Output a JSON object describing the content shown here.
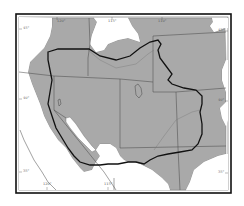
{
  "map": {
    "type": "range map",
    "region": "Western United States",
    "colors": {
      "background": "#ffffff",
      "shaded_region": "#a9a9a9",
      "state_borders": "#555555",
      "range_outline": "#111111",
      "frame": "#111111",
      "water": "#ffffff"
    },
    "longitude_labels_top": [
      "120°",
      "115°",
      "110°"
    ],
    "longitude_labels_bottom": [
      "120°",
      "115°"
    ],
    "latitude_labels_left": [
      "45°",
      "40°",
      "35°"
    ],
    "latitude_labels_right": [
      "45°",
      "40°",
      "35°"
    ],
    "legend": "thick black outline = species range boundary; gray = shaded distribution area"
  }
}
